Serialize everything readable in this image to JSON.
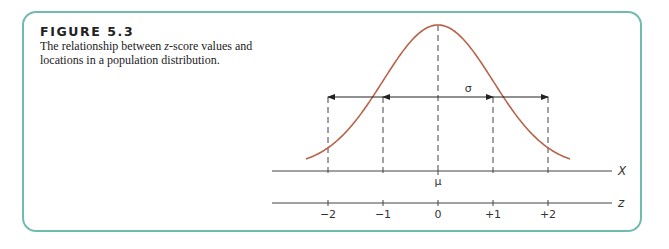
{
  "figure": {
    "title": "FIGURE 5.3",
    "description_pre": "The relationship between ",
    "description_italic": "z",
    "description_post": "-score values and locations in a population distribution."
  },
  "colors": {
    "frame": "#6fbcae",
    "curve": "#b8634a",
    "ink": "#333333"
  },
  "diagram": {
    "x_axis_label": "X",
    "z_axis_label": "z",
    "mean_label": "μ",
    "sigma_label": "σ",
    "z_ticks": [
      {
        "value": -2,
        "label": "−2"
      },
      {
        "value": -1,
        "label": "−1"
      },
      {
        "value": 0,
        "label": "0"
      },
      {
        "value": 1,
        "label": "+1"
      },
      {
        "value": 2,
        "label": "+2"
      }
    ],
    "curve_z_range": [
      -2.4,
      2.4
    ],
    "arrow_spans": [
      {
        "from": 0,
        "to": -1
      },
      {
        "from": -1,
        "to": -2
      },
      {
        "from": 0,
        "to": 1
      },
      {
        "from": 1,
        "to": 2
      }
    ]
  }
}
